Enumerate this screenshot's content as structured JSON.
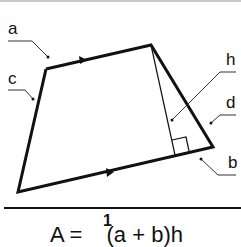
{
  "labels": {
    "a": "a",
    "b": "b",
    "c": "c",
    "d": "d",
    "h": "h"
  },
  "formula": {
    "lhs": "A = ",
    "fraction_numerator": "1",
    "rhs": "(a + b)h"
  },
  "colors": {
    "stroke": "#111111",
    "leader": "#333333",
    "top_border": "#c8c8c8"
  }
}
